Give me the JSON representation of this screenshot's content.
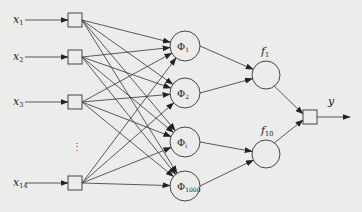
{
  "diagram": {
    "type": "neural-network",
    "colors": {
      "background": "#ececea",
      "stroke": "#333333",
      "text": "#222222"
    },
    "inputs": [
      {
        "label": "x",
        "sub": "1",
        "y": 20
      },
      {
        "label": "x",
        "sub": "2",
        "y": 57
      },
      {
        "label": "x",
        "sub": "3",
        "y": 102
      },
      {
        "label": "x",
        "sub": "14",
        "y": 183
      }
    ],
    "ellipsis": "⋮",
    "hidden_layer": [
      {
        "label": "Φ",
        "sub": "1",
        "y": 46
      },
      {
        "label": "Φ",
        "sub": "2",
        "y": 93
      },
      {
        "label": "Φ",
        "sub": "i",
        "y": 142
      },
      {
        "label": "Φ",
        "sub": "1000",
        "y": 186
      }
    ],
    "second_layer": [
      {
        "label": "f",
        "sub": "1",
        "y": 75
      },
      {
        "label": "f",
        "sub": "10",
        "y": 154
      }
    ],
    "output": {
      "label": "y"
    }
  }
}
